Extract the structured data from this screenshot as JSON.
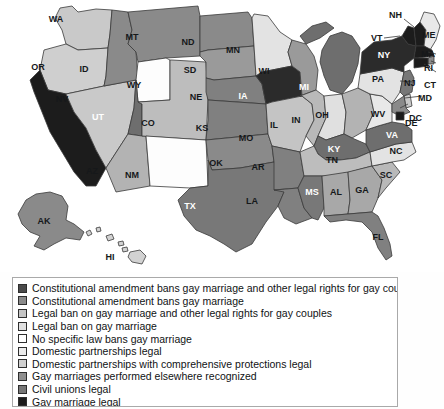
{
  "map": {
    "title": "State laws on gay marriage and legal rights for gay couples",
    "palette": {
      "const_amend_bans_marriage_and_rights": "#4a4a4a",
      "const_amend_bans_marriage": "#6e6e6e",
      "legal_ban_marriage_and_rights": "#b9b9b9",
      "legal_ban_marriage": "#d9d9d9",
      "no_specific_law": "#ffffff",
      "domestic_partnerships": "#e8e8e8",
      "domestic_partnerships_comprehensive": "#c9c9c9",
      "gay_marriages_elsewhere_recognized": "#8a8a8a",
      "civil_unions": "#777777",
      "gay_marriage_legal": "#1c1c1c",
      "outline": "#3a3a3a"
    },
    "states": [
      {
        "code": "WA",
        "name": "Washington",
        "category": "domestic_partnerships_comprehensive",
        "fill": "#c9c9c9",
        "label_color": "dark"
      },
      {
        "code": "OR",
        "name": "Oregon",
        "category": "domestic_partnerships_comprehensive",
        "fill": "#cfcfcf",
        "label_color": "dark"
      },
      {
        "code": "CA",
        "name": "California",
        "category": "gay_marriage_legal",
        "fill": "#1c1c1c",
        "label_color": "light"
      },
      {
        "code": "NV",
        "name": "Nevada",
        "category": "legal_ban_marriage_and_rights",
        "fill": "#c9c9c9",
        "label_color": "dark"
      },
      {
        "code": "ID",
        "name": "Idaho",
        "category": "const_amend_bans_marriage",
        "fill": "#8a8a8a",
        "label_color": "dark"
      },
      {
        "code": "MT",
        "name": "Montana",
        "category": "const_amend_bans_marriage",
        "fill": "#8a8a8a",
        "label_color": "dark"
      },
      {
        "code": "WY",
        "name": "Wyoming",
        "category": "no_specific_law",
        "fill": "#fdfdfd",
        "label_color": "dark"
      },
      {
        "code": "UT",
        "name": "Utah",
        "category": "const_amend_bans_marriage_and_rights",
        "fill": "#6e6e6e",
        "label_color": "light"
      },
      {
        "code": "AZ",
        "name": "Arizona",
        "category": "legal_ban_marriage_and_rights",
        "fill": "#b3b3b3",
        "label_color": "dark"
      },
      {
        "code": "CO",
        "name": "Colorado",
        "category": "legal_ban_marriage_and_rights",
        "fill": "#bdbdbd",
        "label_color": "dark"
      },
      {
        "code": "NM",
        "name": "New Mexico",
        "category": "no_specific_law",
        "fill": "#fdfdfd",
        "label_color": "dark"
      },
      {
        "code": "ND",
        "name": "North Dakota",
        "category": "const_amend_bans_marriage",
        "fill": "#8a8a8a",
        "label_color": "dark"
      },
      {
        "code": "SD",
        "name": "South Dakota",
        "category": "const_amend_bans_marriage",
        "fill": "#9a9a9a",
        "label_color": "dark"
      },
      {
        "code": "NE",
        "name": "Nebraska",
        "category": "const_amend_bans_marriage_and_rights",
        "fill": "#808080",
        "label_color": "dark"
      },
      {
        "code": "KS",
        "name": "Kansas",
        "category": "const_amend_bans_marriage_and_rights",
        "fill": "#808080",
        "label_color": "dark"
      },
      {
        "code": "OK",
        "name": "Oklahoma",
        "category": "const_amend_bans_marriage",
        "fill": "#8a8a8a",
        "label_color": "dark"
      },
      {
        "code": "TX",
        "name": "Texas",
        "category": "const_amend_bans_marriage_and_rights",
        "fill": "#787878",
        "label_color": "light"
      },
      {
        "code": "MN",
        "name": "Minnesota",
        "category": "legal_ban_marriage",
        "fill": "#e3e3e3",
        "label_color": "dark"
      },
      {
        "code": "IA",
        "name": "Iowa",
        "category": "gay_marriage_legal",
        "fill": "#2b2b2b",
        "label_color": "light"
      },
      {
        "code": "MO",
        "name": "Missouri",
        "category": "legal_ban_marriage_and_rights",
        "fill": "#c4c4c4",
        "label_color": "dark"
      },
      {
        "code": "AR",
        "name": "Arkansas",
        "category": "const_amend_bans_marriage_and_rights",
        "fill": "#808080",
        "label_color": "dark"
      },
      {
        "code": "LA",
        "name": "Louisiana",
        "category": "const_amend_bans_marriage_and_rights",
        "fill": "#808080",
        "label_color": "dark"
      },
      {
        "code": "WI",
        "name": "Wisconsin",
        "category": "domestic_partnerships",
        "fill": "#9a9a9a",
        "label_color": "dark"
      },
      {
        "code": "IL",
        "name": "Illinois",
        "category": "legal_ban_marriage",
        "fill": "#b9b9b9",
        "label_color": "dark"
      },
      {
        "code": "MI",
        "name": "Michigan",
        "category": "const_amend_bans_marriage_and_rights",
        "fill": "#6e6e6e",
        "label_color": "light"
      },
      {
        "code": "IN",
        "name": "Indiana",
        "category": "legal_ban_marriage",
        "fill": "#e0e0e0",
        "label_color": "dark"
      },
      {
        "code": "OH",
        "name": "Ohio",
        "category": "const_amend_bans_marriage_and_rights",
        "fill": "#b3b3b3",
        "label_color": "dark"
      },
      {
        "code": "KY",
        "name": "Kentucky",
        "category": "const_amend_bans_marriage_and_rights",
        "fill": "#6e6e6e",
        "label_color": "light"
      },
      {
        "code": "TN",
        "name": "Tennessee",
        "category": "const_amend_bans_marriage",
        "fill": "#bdbdbd",
        "label_color": "dark"
      },
      {
        "code": "MS",
        "name": "Mississippi",
        "category": "const_amend_bans_marriage_and_rights",
        "fill": "#787878",
        "label_color": "light"
      },
      {
        "code": "AL",
        "name": "Alabama",
        "category": "const_amend_bans_marriage",
        "fill": "#a8a8a8",
        "label_color": "dark"
      },
      {
        "code": "GA",
        "name": "Georgia",
        "category": "const_amend_bans_marriage",
        "fill": "#a8a8a8",
        "label_color": "dark"
      },
      {
        "code": "FL",
        "name": "Florida",
        "category": "const_amend_bans_marriage_and_rights",
        "fill": "#808080",
        "label_color": "dark"
      },
      {
        "code": "SC",
        "name": "South Carolina",
        "category": "const_amend_bans_marriage",
        "fill": "#b9b9b9",
        "label_color": "dark"
      },
      {
        "code": "NC",
        "name": "North Carolina",
        "category": "legal_ban_marriage",
        "fill": "#e3e3e3",
        "label_color": "dark"
      },
      {
        "code": "VA",
        "name": "Virginia",
        "category": "const_amend_bans_marriage_and_rights",
        "fill": "#6e6e6e",
        "label_color": "light"
      },
      {
        "code": "WV",
        "name": "West Virginia",
        "category": "legal_ban_marriage",
        "fill": "#e8e8e8",
        "label_color": "dark"
      },
      {
        "code": "PA",
        "name": "Pennsylvania",
        "category": "legal_ban_marriage",
        "fill": "#e3e3e3",
        "label_color": "dark"
      },
      {
        "code": "NY",
        "name": "New York",
        "category": "gay_marriages_elsewhere_recognized",
        "fill": "#2b2b2b",
        "label_color": "light"
      },
      {
        "code": "VT",
        "name": "Vermont",
        "category": "gay_marriage_legal",
        "fill": "#1c1c1c",
        "label_color": "light"
      },
      {
        "code": "NH",
        "name": "New Hampshire",
        "category": "gay_marriage_legal",
        "fill": "#1c1c1c",
        "label_color": "light"
      },
      {
        "code": "ME",
        "name": "Maine",
        "category": "domestic_partnerships",
        "fill": "#e8e8e8",
        "label_color": "dark"
      },
      {
        "code": "MA",
        "name": "Massachusetts",
        "category": "gay_marriage_legal",
        "fill": "#1c1c1c",
        "label_color": "light"
      },
      {
        "code": "RI",
        "name": "Rhode Island",
        "category": "gay_marriages_elsewhere_recognized",
        "fill": "#8a8a8a",
        "label_color": "dark"
      },
      {
        "code": "CT",
        "name": "Connecticut",
        "category": "gay_marriage_legal",
        "fill": "#1c1c1c",
        "label_color": "light"
      },
      {
        "code": "NJ",
        "name": "New Jersey",
        "category": "civil_unions",
        "fill": "#777777",
        "label_color": "light"
      },
      {
        "code": "DE",
        "name": "Delaware",
        "category": "legal_ban_marriage",
        "fill": "#c9c9c9",
        "label_color": "dark"
      },
      {
        "code": "MD",
        "name": "Maryland",
        "category": "gay_marriages_elsewhere_recognized",
        "fill": "#8a8a8a",
        "label_color": "dark"
      },
      {
        "code": "DC",
        "name": "District of Columbia",
        "category": "gay_marriage_legal",
        "fill": "#1c1c1c",
        "label_color": "dark"
      },
      {
        "code": "AK",
        "name": "Alaska",
        "category": "const_amend_bans_marriage",
        "fill": "#8a8a8a",
        "label_color": "dark"
      },
      {
        "code": "HI",
        "name": "Hawaii",
        "category": "legal_ban_marriage_and_rights",
        "fill": "#d2d2d2",
        "label_color": "dark"
      }
    ]
  },
  "legend": {
    "items": [
      {
        "key": "const_amend_bans_marriage_and_rights",
        "color": "#4a4a4a",
        "label": "Constitutional amendment bans gay marriage and other legal rights for gay couples"
      },
      {
        "key": "const_amend_bans_marriage",
        "color": "#8a8a8a",
        "label": "Constitutional amendment bans gay marriage"
      },
      {
        "key": "legal_ban_marriage_and_rights",
        "color": "#c4c4c4",
        "label": "Legal ban on gay marriage and other legal rights for gay couples"
      },
      {
        "key": "legal_ban_marriage",
        "color": "#e0e0e0",
        "label": "Legal ban on gay marriage"
      },
      {
        "key": "no_specific_law",
        "color": "#ffffff",
        "label": "No specific law bans gay marriage"
      },
      {
        "key": "domestic_partnerships",
        "color": "#ebebeb",
        "label": "Domestic partnerships legal"
      },
      {
        "key": "domestic_partnerships_comprehensive",
        "color": "#d0d0d0",
        "label": "Domestic partnerships with comprehensive protections legal"
      },
      {
        "key": "gay_marriages_elsewhere_recognized",
        "color": "#8f8f8f",
        "label": "Gay marriages performed elsewhere recognized"
      },
      {
        "key": "civil_unions",
        "color": "#777777",
        "label": "Civil unions legal"
      },
      {
        "key": "gay_marriage_legal",
        "color": "#1c1c1c",
        "label": "Gay marriage legal"
      }
    ]
  }
}
